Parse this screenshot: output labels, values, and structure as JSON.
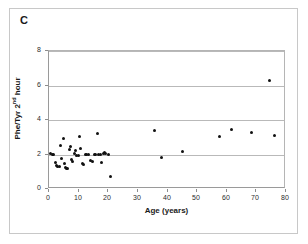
{
  "figure": {
    "panel_label": "C",
    "background_color": "#ffffff",
    "frame_color": "#c8c8c8"
  },
  "chart_data": {
    "type": "scatter",
    "title": "",
    "panel": "C",
    "xlabel": "Age (years)",
    "ylabel": "Phe/Tyr 2nd hour",
    "ylabel_main": "Phe/Tyr 2",
    "ylabel_sup": "nd",
    "ylabel_tail": " hour",
    "xlim": [
      0,
      80
    ],
    "ylim": [
      0,
      8
    ],
    "xticks": [
      0,
      10,
      20,
      30,
      40,
      50,
      60,
      70,
      80
    ],
    "yticks": [
      0,
      2,
      4,
      6,
      8
    ],
    "xtick_labels": [
      "0",
      "10",
      "20",
      "30",
      "40",
      "50",
      "60",
      "70",
      "80"
    ],
    "ytick_labels": [
      "0",
      "2",
      "4",
      "6",
      "8"
    ],
    "grid": "horizontal",
    "legend": "none",
    "marker_color": "#111111",
    "marker_size": 3,
    "series": [
      {
        "name": "Phe/Tyr ratio at 2nd hour vs age",
        "points": [
          [
            0.6,
            2.05
          ],
          [
            1.2,
            2.02
          ],
          [
            1.6,
            1.98
          ],
          [
            2.2,
            1.55
          ],
          [
            2.6,
            1.35
          ],
          [
            3.0,
            1.28
          ],
          [
            3.4,
            1.3
          ],
          [
            4.0,
            2.55
          ],
          [
            4.2,
            1.78
          ],
          [
            4.8,
            2.9
          ],
          [
            5.2,
            1.45
          ],
          [
            5.6,
            1.22
          ],
          [
            5.9,
            1.2
          ],
          [
            6.3,
            1.18
          ],
          [
            6.8,
            2.3
          ],
          [
            7.2,
            2.45
          ],
          [
            7.6,
            1.7
          ],
          [
            8.0,
            1.6
          ],
          [
            8.6,
            2.05
          ],
          [
            9.0,
            2.22
          ],
          [
            9.4,
            1.95
          ],
          [
            9.8,
            1.92
          ],
          [
            10.2,
            3.05
          ],
          [
            10.6,
            2.35
          ],
          [
            11.2,
            1.48
          ],
          [
            11.8,
            1.42
          ],
          [
            12.4,
            2.0
          ],
          [
            12.8,
            1.98
          ],
          [
            13.4,
            2.02
          ],
          [
            14.0,
            1.65
          ],
          [
            14.6,
            1.62
          ],
          [
            15.2,
            2.0
          ],
          [
            15.8,
            1.99
          ],
          [
            16.4,
            3.2
          ],
          [
            16.8,
            2.0
          ],
          [
            17.4,
            2.02
          ],
          [
            17.8,
            1.55
          ],
          [
            18.4,
            2.05
          ],
          [
            18.8,
            2.12
          ],
          [
            19.2,
            2.08
          ],
          [
            20.0,
            2.0
          ],
          [
            20.6,
            0.75
          ],
          [
            35.5,
            3.4
          ],
          [
            38.0,
            1.85
          ],
          [
            45.0,
            2.15
          ],
          [
            57.5,
            3.05
          ],
          [
            61.5,
            3.45
          ],
          [
            68.5,
            3.25
          ],
          [
            74.5,
            6.3
          ],
          [
            76.0,
            3.1
          ]
        ]
      }
    ]
  }
}
